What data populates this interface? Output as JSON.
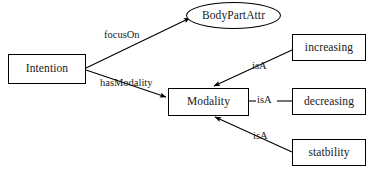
{
  "diagram": {
    "background_color": "#ffffff",
    "stroke_color": "#000000",
    "nodes": [
      {
        "id": "intention",
        "label": "Intention",
        "shape": "rect"
      },
      {
        "id": "bodypartattr",
        "label": "BodyPartAttr",
        "shape": "ellipse"
      },
      {
        "id": "modality",
        "label": "Modality",
        "shape": "rect"
      },
      {
        "id": "increasing",
        "label": "increasing",
        "shape": "rect"
      },
      {
        "id": "decreasing",
        "label": "decreasing",
        "shape": "rect"
      },
      {
        "id": "statbility",
        "label": "statbility",
        "shape": "rect"
      }
    ],
    "edges": [
      {
        "id": "e-focuson",
        "label": "focusOn",
        "from": "intention",
        "to": "bodypartattr",
        "arrow": true
      },
      {
        "id": "e-hasmodality",
        "label": "hasModality",
        "from": "intention",
        "to": "modality",
        "arrow": true
      },
      {
        "id": "e-isa-inc",
        "label": "isA",
        "from": "increasing",
        "to": "modality",
        "arrow": true
      },
      {
        "id": "e-isa-dec",
        "label": "isA",
        "from": "decreasing",
        "to": "modality",
        "arrow": false
      },
      {
        "id": "e-isa-sta",
        "label": "isA",
        "from": "statbility",
        "to": "modality",
        "arrow": true
      }
    ],
    "caption": ""
  }
}
